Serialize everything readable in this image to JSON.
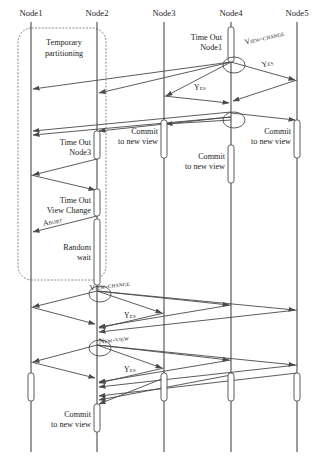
{
  "diagram": {
    "width": 322,
    "height": 457,
    "stroke_color": "#4a4a4a",
    "lifeline_color": "#3a3a3a",
    "partition_color": "#8a8a8a",
    "background": "#ffffff"
  },
  "lifelines": [
    {
      "id": "n1",
      "label": "Node1",
      "x": 31,
      "label_y": 16,
      "top": 22,
      "bottom": 452
    },
    {
      "id": "n2",
      "label": "Node2",
      "x": 97,
      "label_y": 16,
      "top": 22,
      "bottom": 452
    },
    {
      "id": "n3",
      "label": "Node3",
      "x": 164,
      "label_y": 16,
      "top": 22,
      "bottom": 452
    },
    {
      "id": "n4",
      "label": "Node4",
      "x": 231,
      "label_y": 16,
      "top": 22,
      "bottom": 452
    },
    {
      "id": "n5",
      "label": "Node5",
      "x": 297,
      "label_y": 16,
      "top": 22,
      "bottom": 452
    }
  ],
  "partition": {
    "label_line1": "Temporary",
    "label_line2": "partitioning",
    "label_x": 64,
    "label_y1": 45,
    "label_y2": 56,
    "box": {
      "x": 18,
      "y": 28,
      "width": 88,
      "height": 252,
      "rx": 14
    }
  },
  "notes": [
    {
      "id": "note-timeout-node1",
      "lines": [
        "Time Out",
        "Node1"
      ],
      "x": 222,
      "y": 40,
      "anchor": "end"
    },
    {
      "id": "note-timeout-node3",
      "lines": [
        "Time Out",
        "Node3"
      ],
      "x": 91,
      "y": 145,
      "anchor": "end"
    },
    {
      "id": "note-commit-n3",
      "lines": [
        "Commit",
        "to new view"
      ],
      "x": 158,
      "y": 134,
      "anchor": "end"
    },
    {
      "id": "note-commit-n4",
      "lines": [
        "Commit",
        "to new view"
      ],
      "x": 225,
      "y": 159,
      "anchor": "end"
    },
    {
      "id": "note-commit-n5",
      "lines": [
        "Commit",
        "to new view"
      ],
      "x": 291,
      "y": 134,
      "anchor": "end"
    },
    {
      "id": "note-timeout-viewchange",
      "lines": [
        "Time Out",
        "View Change"
      ],
      "x": 91,
      "y": 203,
      "anchor": "end"
    },
    {
      "id": "note-random-wait",
      "lines": [
        "Random",
        "wait"
      ],
      "x": 91,
      "y": 250,
      "anchor": "end"
    },
    {
      "id": "note-commit-bottom",
      "lines": [
        "Commit",
        "to new view"
      ],
      "x": 91,
      "y": 417,
      "anchor": "end"
    }
  ],
  "message_labels": [
    {
      "id": "lbl-view-change-1",
      "text": "View-change",
      "x": 265,
      "y": 40,
      "rotate": -13
    },
    {
      "id": "lbl-yes-1",
      "text": "Yes",
      "x": 268,
      "y": 66,
      "rotate": -12
    },
    {
      "id": "lbl-yes-2",
      "text": "Yes",
      "x": 200,
      "y": 90,
      "rotate": 0
    },
    {
      "id": "lbl-abort",
      "text": "Abort",
      "x": 53,
      "y": 224,
      "rotate": -11
    },
    {
      "id": "lbl-view-change-2",
      "text": "View-change",
      "x": 110,
      "y": 288,
      "rotate": -7
    },
    {
      "id": "lbl-yes-3",
      "text": "Yes",
      "x": 130,
      "y": 318,
      "rotate": 0
    },
    {
      "id": "lbl-new-view",
      "text": "New-view",
      "x": 114,
      "y": 342,
      "rotate": -7
    },
    {
      "id": "lbl-yes-4",
      "text": "Yes",
      "x": 130,
      "y": 372,
      "rotate": 0
    }
  ],
  "activations": [
    {
      "id": "act-n4-timeout",
      "x": 231,
      "y": 27,
      "w": 6,
      "h": 35
    },
    {
      "id": "act-n2-timeout3",
      "x": 97,
      "y": 131,
      "w": 6,
      "h": 28
    },
    {
      "id": "act-n3-commit",
      "x": 164,
      "y": 120,
      "w": 6,
      "h": 38
    },
    {
      "id": "act-n5-commit",
      "x": 297,
      "y": 120,
      "w": 6,
      "h": 38
    },
    {
      "id": "act-n4-commit",
      "x": 231,
      "y": 145,
      "w": 6,
      "h": 38
    },
    {
      "id": "act-n2-timeoutvc",
      "x": 97,
      "y": 189,
      "w": 6,
      "h": 27
    },
    {
      "id": "act-n2-random",
      "x": 97,
      "y": 219,
      "w": 6,
      "h": 66
    },
    {
      "id": "act-n1-final",
      "x": 31,
      "y": 373,
      "w": 6,
      "h": 28
    },
    {
      "id": "act-n3-final",
      "x": 164,
      "y": 373,
      "w": 6,
      "h": 28
    },
    {
      "id": "act-n4-final",
      "x": 231,
      "y": 373,
      "w": 6,
      "h": 28
    },
    {
      "id": "act-n5-final",
      "x": 297,
      "y": 373,
      "w": 6,
      "h": 28
    },
    {
      "id": "act-n2-commit-bot",
      "x": 97,
      "y": 404,
      "w": 6,
      "h": 28
    }
  ],
  "markers": [
    {
      "id": "marker-n4-vc",
      "cx": 234,
      "cy": 65,
      "rx": 11,
      "ry": 8
    },
    {
      "id": "marker-n4-nv",
      "cx": 234,
      "cy": 120,
      "rx": 11,
      "ry": 8
    },
    {
      "id": "marker-n2-vc",
      "cx": 100,
      "cy": 294,
      "rx": 11,
      "ry": 8
    },
    {
      "id": "marker-n2-nv",
      "cx": 100,
      "cy": 348,
      "rx": 11,
      "ry": 8
    }
  ],
  "messages": [
    {
      "id": "m-vc-n4-n1",
      "from": "n4",
      "to": "n1",
      "x1": 231,
      "y1": 62,
      "x2": 33,
      "y2": 89
    },
    {
      "id": "m-vc-n4-n2",
      "from": "n4",
      "to": "n2",
      "x1": 231,
      "y1": 62,
      "x2": 99,
      "y2": 93
    },
    {
      "id": "m-vc-n4-n3",
      "from": "n4",
      "to": "n3",
      "x1": 231,
      "y1": 62,
      "x2": 166,
      "y2": 96
    },
    {
      "id": "m-vc-n4-n5",
      "from": "n4",
      "to": "n5",
      "x1": 231,
      "y1": 62,
      "x2": 295,
      "y2": 80
    },
    {
      "id": "m-yes-n5-n4",
      "from": "n5",
      "to": "n4",
      "x1": 297,
      "y1": 80,
      "x2": 233,
      "y2": 101
    },
    {
      "id": "m-yes-n3-n4",
      "from": "n3",
      "to": "n4",
      "x1": 164,
      "y1": 96,
      "x2": 229,
      "y2": 103
    },
    {
      "id": "m-nv-n4-n1",
      "from": "n4",
      "to": "n1",
      "x1": 231,
      "y1": 117,
      "x2": 33,
      "y2": 135
    },
    {
      "id": "m-nv-n4-n2",
      "from": "n4",
      "to": "n2",
      "x1": 231,
      "y1": 117,
      "x2": 99,
      "y2": 131
    },
    {
      "id": "m-nv-n4-n3",
      "from": "n4",
      "to": "n3",
      "x1": 231,
      "y1": 120,
      "x2": 166,
      "y2": 124
    },
    {
      "id": "m-nv-n4-n5",
      "from": "n4",
      "to": "n5",
      "x1": 231,
      "y1": 113,
      "x2": 295,
      "y2": 120
    },
    {
      "id": "m-nv2-n4-n1",
      "from": "n4",
      "to": "n1",
      "x1": 231,
      "y1": 112,
      "x2": 33,
      "y2": 131
    },
    {
      "id": "m-to3-n2-n1",
      "from": "n2",
      "to": "n1",
      "x1": 97,
      "y1": 159,
      "x2": 33,
      "y2": 175
    },
    {
      "id": "m-to3-n1-n2",
      "from": "n1",
      "to": "n2",
      "x1": 31,
      "y1": 175,
      "x2": 95,
      "y2": 190
    },
    {
      "id": "m-abort-n2-n1",
      "from": "n2",
      "to": "n1",
      "x1": 97,
      "y1": 216,
      "x2": 33,
      "y2": 232
    },
    {
      "id": "m-vc2-n2-n1",
      "from": "n2",
      "to": "n1",
      "x1": 97,
      "y1": 291,
      "x2": 33,
      "y2": 307
    },
    {
      "id": "m-vc2-n2-n3",
      "from": "n2",
      "to": "n3",
      "x1": 97,
      "y1": 291,
      "x2": 162,
      "y2": 313
    },
    {
      "id": "m-vc2-n2-n4",
      "from": "n2",
      "to": "n4",
      "x1": 97,
      "y1": 291,
      "x2": 229,
      "y2": 305
    },
    {
      "id": "m-vc2-n2-n5",
      "from": "n2",
      "to": "n5",
      "x1": 97,
      "y1": 291,
      "x2": 295,
      "y2": 310
    },
    {
      "id": "m-yes3-n1-n2",
      "from": "n1",
      "to": "n2",
      "x1": 31,
      "y1": 307,
      "x2": 95,
      "y2": 324
    },
    {
      "id": "m-yes3-n3-n2",
      "from": "n3",
      "to": "n2",
      "x1": 164,
      "y1": 313,
      "x2": 99,
      "y2": 328
    },
    {
      "id": "m-yes3-n4-n2",
      "from": "n4",
      "to": "n2",
      "x1": 231,
      "y1": 305,
      "x2": 99,
      "y2": 327
    },
    {
      "id": "m-yes3-n5-n2",
      "from": "n5",
      "to": "n2",
      "x1": 297,
      "y1": 310,
      "x2": 99,
      "y2": 332
    },
    {
      "id": "m-nv2-n2-n1",
      "from": "n2",
      "to": "n1",
      "x1": 97,
      "y1": 345,
      "x2": 33,
      "y2": 362
    },
    {
      "id": "m-nv2-n2-n3",
      "from": "n2",
      "to": "n3",
      "x1": 97,
      "y1": 345,
      "x2": 162,
      "y2": 368
    },
    {
      "id": "m-nv2-n2-n4",
      "from": "n2",
      "to": "n4",
      "x1": 97,
      "y1": 345,
      "x2": 229,
      "y2": 360
    },
    {
      "id": "m-nv2-n2-n5",
      "from": "n2",
      "to": "n5",
      "x1": 97,
      "y1": 345,
      "x2": 295,
      "y2": 365
    },
    {
      "id": "m-yes4-n1-n2",
      "from": "n1",
      "to": "n2",
      "x1": 31,
      "y1": 362,
      "x2": 95,
      "y2": 378
    },
    {
      "id": "m-yes4-n3-n2",
      "from": "n3",
      "to": "n2",
      "x1": 164,
      "y1": 368,
      "x2": 99,
      "y2": 383
    },
    {
      "id": "m-yes4-n4-n2",
      "from": "n4",
      "to": "n2",
      "x1": 231,
      "y1": 360,
      "x2": 99,
      "y2": 382
    },
    {
      "id": "m-yes4-n5-n2",
      "from": "n5",
      "to": "n2",
      "x1": 297,
      "y1": 365,
      "x2": 99,
      "y2": 387
    },
    {
      "id": "m-final-n5-n2",
      "from": "n5",
      "to": "n2",
      "x1": 297,
      "y1": 373,
      "x2": 99,
      "y2": 396
    },
    {
      "id": "m-final-n4-n2",
      "from": "n4",
      "to": "n2",
      "x1": 231,
      "y1": 375,
      "x2": 99,
      "y2": 400
    },
    {
      "id": "m-final-n3-n2",
      "from": "n3",
      "to": "n2",
      "x1": 164,
      "y1": 378,
      "x2": 99,
      "y2": 404
    }
  ]
}
